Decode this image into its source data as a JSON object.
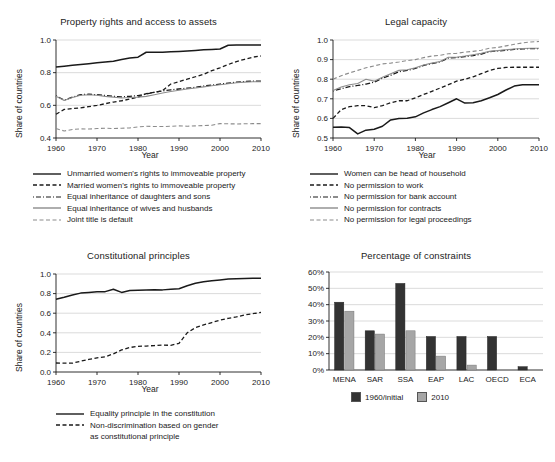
{
  "figure": {
    "background": "#ffffff",
    "ink": "#1a1a1a",
    "grid_color": "#cccccc",
    "dark_bar_color": "#333333",
    "light_bar_color": "#a6a6a6"
  },
  "panels": {
    "property_rights": {
      "title": "Property rights and access to assets",
      "xlabel": "Year",
      "ylabel": "Share of countries",
      "yticks": [
        "0.4",
        "0.6",
        "0.8",
        "1.0"
      ],
      "xticks": [
        "1960",
        "1970",
        "1980",
        "1990",
        "2000",
        "2010"
      ],
      "legend": [
        "Unmarried women's rights to immoveable property",
        "Married women's rights to immoveable property",
        "Equal inheritance of daughters and sons",
        "Equal inheritance of wives and husbands",
        "Joint title is default"
      ]
    },
    "legal_capacity": {
      "title": "Legal capacity",
      "xlabel": "Year",
      "ylabel": "Share of countries",
      "yticks": [
        "0.5",
        "0.6",
        "0.7",
        "0.8",
        "0.9",
        "1.0"
      ],
      "xticks": [
        "1960",
        "1970",
        "1980",
        "1990",
        "2000",
        "2010"
      ],
      "legend": [
        "Women can be head of household",
        "No permission to work",
        "No permission for bank account",
        "No permission for contracts",
        "No permission for legal proceedings"
      ]
    },
    "constitutional": {
      "title": "Constitutional principles",
      "xlabel": "Year",
      "ylabel": "Share of countries",
      "yticks": [
        "0.0",
        "0.2",
        "0.4",
        "0.6",
        "0.8",
        "1.0"
      ],
      "xticks": [
        "1960",
        "1970",
        "1980",
        "1990",
        "2000",
        "2010"
      ],
      "legend": [
        "Equality principle in the constitution",
        "Non-discrimination based on gender",
        "as constitutional principle"
      ]
    },
    "constraints": {
      "title": "Percentage of constraints",
      "yticks": [
        "0%",
        "10%",
        "20%",
        "30%",
        "40%",
        "50%",
        "60%"
      ],
      "legend": [
        "1960/initial",
        "2010"
      ]
    }
  },
  "chart_data": [
    {
      "type": "line",
      "title": "Property rights and access to assets",
      "xlabel": "Year",
      "ylabel": "Share of countries",
      "xlim": [
        1960,
        2010
      ],
      "ylim": [
        0.4,
        1.0
      ],
      "grid": true,
      "legend_position": "below",
      "x": [
        1960,
        1962,
        1964,
        1966,
        1968,
        1970,
        1972,
        1974,
        1976,
        1978,
        1980,
        1982,
        1984,
        1986,
        1988,
        1990,
        1992,
        1994,
        1996,
        1998,
        2000,
        2002,
        2004,
        2006,
        2008,
        2010
      ],
      "series": [
        {
          "name": "Unmarried women's rights to immoveable property",
          "style": "solid",
          "color": "#1a1a1a",
          "values": [
            0.835,
            0.84,
            0.845,
            0.85,
            0.855,
            0.86,
            0.865,
            0.87,
            0.88,
            0.89,
            0.895,
            0.925,
            0.925,
            0.925,
            0.928,
            0.93,
            0.933,
            0.936,
            0.94,
            0.942,
            0.945,
            0.968,
            0.97,
            0.97,
            0.97,
            0.97
          ]
        },
        {
          "name": "Married women's rights to immoveable property",
          "style": "dashed",
          "color": "#1a1a1a",
          "values": [
            0.545,
            0.575,
            0.58,
            0.585,
            0.592,
            0.6,
            0.61,
            0.62,
            0.628,
            0.638,
            0.65,
            0.672,
            0.68,
            0.69,
            0.73,
            0.745,
            0.76,
            0.775,
            0.79,
            0.812,
            0.83,
            0.85,
            0.868,
            0.882,
            0.895,
            0.902
          ]
        },
        {
          "name": "Equal inheritance of daughters and sons",
          "style": "dashdot",
          "color": "#1a1a1a",
          "values": [
            0.658,
            0.632,
            0.65,
            0.665,
            0.668,
            0.665,
            0.66,
            0.655,
            0.652,
            0.655,
            0.66,
            0.67,
            0.68,
            0.688,
            0.695,
            0.7,
            0.705,
            0.71,
            0.718,
            0.724,
            0.73,
            0.736,
            0.742,
            0.746,
            0.748,
            0.748
          ]
        },
        {
          "name": "Equal inheritance of wives and husbands",
          "style": "solid-gray",
          "color": "#8c8c8c",
          "values": [
            0.655,
            0.63,
            0.648,
            0.662,
            0.665,
            0.662,
            0.655,
            0.65,
            0.645,
            0.648,
            0.65,
            0.655,
            0.665,
            0.675,
            0.685,
            0.692,
            0.7,
            0.706,
            0.713,
            0.72,
            0.726,
            0.732,
            0.738,
            0.742,
            0.744,
            0.744
          ]
        },
        {
          "name": "Joint title is default",
          "style": "dashed-gray",
          "color": "#8c8c8c",
          "values": [
            0.458,
            0.443,
            0.452,
            0.456,
            0.455,
            0.458,
            0.46,
            0.458,
            0.46,
            0.462,
            0.468,
            0.472,
            0.47,
            0.47,
            0.472,
            0.474,
            0.472,
            0.474,
            0.476,
            0.478,
            0.488,
            0.487,
            0.486,
            0.487,
            0.488,
            0.488
          ]
        }
      ]
    },
    {
      "type": "line",
      "title": "Legal capacity",
      "xlabel": "Year",
      "ylabel": "Share of countries",
      "xlim": [
        1960,
        2010
      ],
      "ylim": [
        0.5,
        1.0
      ],
      "grid": true,
      "legend_position": "below",
      "x": [
        1960,
        1962,
        1964,
        1966,
        1968,
        1970,
        1972,
        1974,
        1976,
        1978,
        1980,
        1982,
        1984,
        1986,
        1988,
        1990,
        1992,
        1994,
        1996,
        1998,
        2000,
        2002,
        2004,
        2006,
        2008,
        2010
      ],
      "series": [
        {
          "name": "Women can be head of household",
          "style": "solid",
          "color": "#1a1a1a",
          "values": [
            0.555,
            0.556,
            0.553,
            0.521,
            0.54,
            0.545,
            0.56,
            0.592,
            0.6,
            0.601,
            0.608,
            0.628,
            0.645,
            0.66,
            0.68,
            0.7,
            0.678,
            0.68,
            0.69,
            0.705,
            0.722,
            0.745,
            0.765,
            0.772,
            0.772,
            0.772
          ]
        },
        {
          "name": "No permission to work",
          "style": "dashed",
          "color": "#1a1a1a",
          "values": [
            0.6,
            0.645,
            0.66,
            0.665,
            0.665,
            0.655,
            0.665,
            0.68,
            0.69,
            0.69,
            0.705,
            0.722,
            0.738,
            0.755,
            0.772,
            0.79,
            0.8,
            0.812,
            0.828,
            0.845,
            0.855,
            0.86,
            0.861,
            0.861,
            0.861,
            0.861
          ]
        },
        {
          "name": "No permission for bank account",
          "style": "dashdot",
          "color": "#1a1a1a",
          "values": [
            0.74,
            0.752,
            0.762,
            0.768,
            0.775,
            0.785,
            0.805,
            0.82,
            0.838,
            0.845,
            0.855,
            0.87,
            0.88,
            0.888,
            0.908,
            0.91,
            0.915,
            0.92,
            0.928,
            0.94,
            0.944,
            0.948,
            0.952,
            0.955,
            0.956,
            0.956
          ]
        },
        {
          "name": "No permission for contracts",
          "style": "solid-gray",
          "color": "#8c8c8c",
          "values": [
            0.742,
            0.76,
            0.772,
            0.778,
            0.8,
            0.79,
            0.81,
            0.828,
            0.845,
            0.848,
            0.858,
            0.872,
            0.882,
            0.89,
            0.912,
            0.912,
            0.918,
            0.925,
            0.932,
            0.942,
            0.946,
            0.95,
            0.954,
            0.957,
            0.958,
            0.958
          ]
        },
        {
          "name": "No permission for legal proceedings",
          "style": "dashed-gray",
          "color": "#8c8c8c",
          "values": [
            0.8,
            0.818,
            0.832,
            0.845,
            0.858,
            0.868,
            0.878,
            0.882,
            0.888,
            0.895,
            0.9,
            0.91,
            0.918,
            0.922,
            0.93,
            0.932,
            0.938,
            0.942,
            0.948,
            0.958,
            0.962,
            0.97,
            0.978,
            0.985,
            0.99,
            0.992
          ]
        }
      ]
    },
    {
      "type": "line",
      "title": "Constitutional principles",
      "xlabel": "Year",
      "ylabel": "Share of countries",
      "xlim": [
        1960,
        2010
      ],
      "ylim": [
        0.0,
        1.0
      ],
      "grid": true,
      "legend_position": "below",
      "x": [
        1960,
        1962,
        1964,
        1966,
        1968,
        1970,
        1972,
        1974,
        1976,
        1978,
        1980,
        1982,
        1984,
        1986,
        1988,
        1990,
        1992,
        1994,
        1996,
        1998,
        2000,
        2002,
        2004,
        2006,
        2008,
        2010
      ],
      "series": [
        {
          "name": "Equality principle in the constitution",
          "style": "solid",
          "color": "#1a1a1a",
          "values": [
            0.742,
            0.762,
            0.785,
            0.805,
            0.812,
            0.818,
            0.82,
            0.845,
            0.812,
            0.832,
            0.835,
            0.838,
            0.84,
            0.838,
            0.845,
            0.85,
            0.88,
            0.905,
            0.92,
            0.932,
            0.94,
            0.948,
            0.952,
            0.955,
            0.957,
            0.957
          ]
        },
        {
          "name": "Non-discrimination based on gender as constitutional principle",
          "style": "dashed",
          "color": "#1a1a1a",
          "values": [
            0.092,
            0.09,
            0.09,
            0.11,
            0.128,
            0.145,
            0.155,
            0.185,
            0.225,
            0.25,
            0.262,
            0.265,
            0.27,
            0.275,
            0.272,
            0.292,
            0.4,
            0.452,
            0.48,
            0.505,
            0.53,
            0.548,
            0.562,
            0.582,
            0.595,
            0.608
          ]
        }
      ]
    },
    {
      "type": "bar",
      "title": "Percentage of constraints",
      "xlabel": "",
      "ylabel": "",
      "ylim": [
        0,
        60
      ],
      "grid": true,
      "legend_position": "below",
      "categories": [
        "MENA",
        "SAR",
        "SSA",
        "EAP",
        "LAC",
        "OECD",
        "ECA"
      ],
      "series": [
        {
          "name": "1960/initial",
          "color": "#333333",
          "values": [
            41.5,
            24.0,
            53.0,
            20.5,
            20.5,
            20.5,
            2.0
          ]
        },
        {
          "name": "2010",
          "color": "#a6a6a6",
          "values": [
            36.0,
            22.0,
            24.0,
            8.5,
            3.0,
            0.0,
            0.0
          ]
        }
      ]
    }
  ]
}
